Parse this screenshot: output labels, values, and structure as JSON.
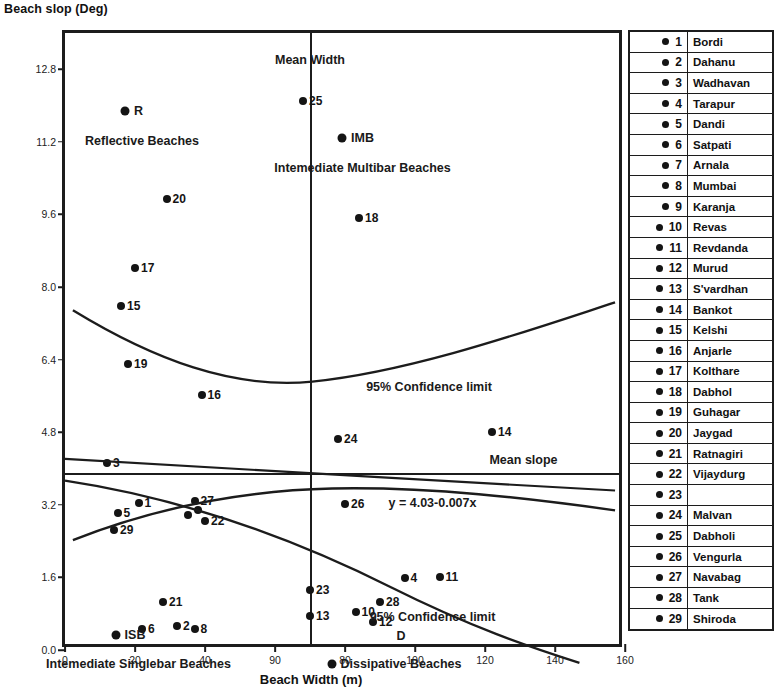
{
  "chart_data": {
    "type": "scatter",
    "title": "",
    "xlabel": "Beach Width (m)",
    "ylabel": "Beach slop (Deg)",
    "xlim": [
      0,
      160
    ],
    "ylim": [
      0,
      13.6
    ],
    "xticks": [
      "0",
      "20",
      "40",
      "90",
      "80",
      "100",
      "120",
      "140",
      "160"
    ],
    "xtick_values": [
      0,
      20,
      40,
      60,
      80,
      100,
      120,
      140,
      160
    ],
    "yticks": [
      "0.0",
      "1.6",
      "3.2",
      "4.8",
      "6.4",
      "8.0",
      "9.6",
      "11.2",
      "12.8"
    ],
    "ytick_values": [
      0.0,
      1.6,
      3.2,
      4.8,
      6.4,
      8.0,
      9.6,
      11.2,
      12.8
    ],
    "grid": false,
    "legend_position": "right",
    "regression_equation": "y = 4.03-0.007x",
    "mean_width": 70,
    "mean_slope": 3.9,
    "points": [
      {
        "id": "1",
        "x": 21,
        "y": 3.25
      },
      {
        "id": "2",
        "x": 32,
        "y": 0.52
      },
      {
        "id": "3",
        "x": 12,
        "y": 4.12
      },
      {
        "id": "4",
        "x": 97,
        "y": 1.58
      },
      {
        "id": "5",
        "x": 15,
        "y": 3.02
      },
      {
        "id": "6",
        "x": 22,
        "y": 0.47
      },
      {
        "id": "8",
        "x": 37,
        "y": 0.47
      },
      {
        "id": "10",
        "x": 83,
        "y": 0.84
      },
      {
        "id": "11",
        "x": 107,
        "y": 1.62
      },
      {
        "id": "12",
        "x": 88,
        "y": 0.62
      },
      {
        "id": "13",
        "x": 70,
        "y": 0.76
      },
      {
        "id": "14",
        "x": 122,
        "y": 4.8
      },
      {
        "id": "15",
        "x": 16,
        "y": 7.58
      },
      {
        "id": "16",
        "x": 39,
        "y": 5.62
      },
      {
        "id": "17",
        "x": 20,
        "y": 8.42
      },
      {
        "id": "18",
        "x": 84,
        "y": 9.52
      },
      {
        "id": "19",
        "x": 18,
        "y": 6.3
      },
      {
        "id": "20",
        "x": 29,
        "y": 9.95
      },
      {
        "id": "21",
        "x": 28,
        "y": 1.05
      },
      {
        "id": "22",
        "x": 40,
        "y": 2.85
      },
      {
        "id": "23",
        "x": 70,
        "y": 1.32
      },
      {
        "id": "24",
        "x": 78,
        "y": 4.65
      },
      {
        "id": "25",
        "x": 68,
        "y": 12.1
      },
      {
        "id": "26",
        "x": 80,
        "y": 3.22
      },
      {
        "id": "27",
        "x": 37,
        "y": 3.28
      },
      {
        "id": "28",
        "x": 90,
        "y": 1.05
      },
      {
        "id": "29",
        "x": 14,
        "y": 2.65
      },
      {
        "id": "",
        "x": 35,
        "y": 2.98
      },
      {
        "id": "",
        "x": 38,
        "y": 3.08
      }
    ],
    "annotations": [
      {
        "key": "mean_width",
        "text": "Mean Width",
        "x": 70,
        "y": 13.0
      },
      {
        "key": "mean_slope",
        "text": "Mean slope",
        "x": 131,
        "y": 4.18
      },
      {
        "key": "equation",
        "text": "y = 4.03-0.007x",
        "x": 105,
        "y": 3.25
      },
      {
        "key": "ci_upper",
        "text": "95% Confidence limit",
        "x": 104,
        "y": 5.8
      },
      {
        "key": "ci_lower",
        "text": "95% Confidence limit",
        "x": 105,
        "y": 0.72
      },
      {
        "key": "r_label",
        "text": "R",
        "x": 21,
        "y": 11.88
      },
      {
        "key": "reflective",
        "text": "Reflective Beaches",
        "x": 22,
        "y": 11.22
      },
      {
        "key": "imb_label",
        "text": "IMB",
        "x": 85,
        "y": 11.28
      },
      {
        "key": "imb_full",
        "text": "Intemediate Multibar Beaches",
        "x": 85,
        "y": 10.62
      },
      {
        "key": "isb_label",
        "text": "ISB",
        "x": 20,
        "y": 0.33
      },
      {
        "key": "isb_full",
        "text": "Intemediate Singlebar Beaches",
        "x": 21,
        "y": -0.3
      },
      {
        "key": "d_label",
        "text": "D",
        "x": 96,
        "y": 0.3
      },
      {
        "key": "dissipative",
        "text": "Dissipative Beaches",
        "x": 96,
        "y": -0.3
      }
    ],
    "legend_title": "",
    "legend": [
      {
        "num": "1",
        "name": "Bordi"
      },
      {
        "num": "2",
        "name": "Dahanu"
      },
      {
        "num": "3",
        "name": "Wadhavan"
      },
      {
        "num": "4",
        "name": "Tarapur"
      },
      {
        "num": "5",
        "name": "Dandi"
      },
      {
        "num": "6",
        "name": "Satpati"
      },
      {
        "num": "7",
        "name": "Arnala"
      },
      {
        "num": "8",
        "name": "Mumbai"
      },
      {
        "num": "9",
        "name": "Karanja"
      },
      {
        "num": "10",
        "name": "Revas"
      },
      {
        "num": "11",
        "name": "Revdanda"
      },
      {
        "num": "12",
        "name": "Murud"
      },
      {
        "num": "13",
        "name": "S'vardhan"
      },
      {
        "num": "14",
        "name": "Bankot"
      },
      {
        "num": "15",
        "name": "Kelshi"
      },
      {
        "num": "16",
        "name": "Anjarle"
      },
      {
        "num": "17",
        "name": "Kolthare"
      },
      {
        "num": "18",
        "name": "Dabhol"
      },
      {
        "num": "19",
        "name": "Guhagar"
      },
      {
        "num": "20",
        "name": "Jaygad"
      },
      {
        "num": "21",
        "name": "Ratnagiri"
      },
      {
        "num": "22",
        "name": "Vijaydurg"
      },
      {
        "num": "23",
        "name": ""
      },
      {
        "num": "24",
        "name": "Malvan"
      },
      {
        "num": "25",
        "name": "Dabholi"
      },
      {
        "num": "26",
        "name": "Vengurla"
      },
      {
        "num": "27",
        "name": "Navabag"
      },
      {
        "num": "28",
        "name": "Tank"
      },
      {
        "num": "29",
        "name": "Shiroda"
      }
    ]
  }
}
